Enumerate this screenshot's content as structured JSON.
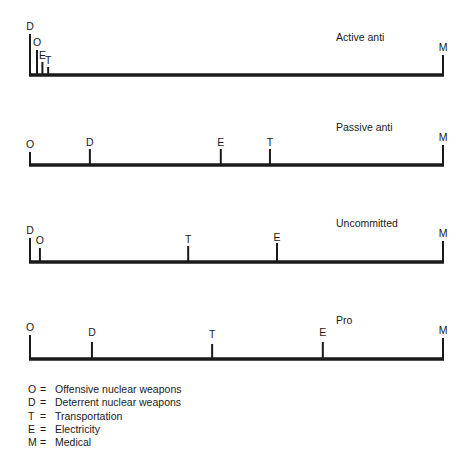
{
  "scale": {
    "x_start": 30,
    "x_end": 443
  },
  "panels": [
    {
      "title": "Active anti",
      "title_pos": {
        "x": 336,
        "y": 41
      },
      "baseline_y": 75,
      "markers": [
        {
          "key": "D",
          "pos": 0,
          "top": 34,
          "label_y": 30
        },
        {
          "key": "O",
          "pos": 1.7,
          "top": 50,
          "label_y": 46
        },
        {
          "key": "E",
          "pos": 3.0,
          "top": 62,
          "label_y": 59
        },
        {
          "key": "T",
          "pos": 4.4,
          "top": 67,
          "label_y": 64
        },
        {
          "key": "M",
          "pos": 100,
          "top": 55,
          "label_y": 51
        }
      ]
    },
    {
      "title": "Passive anti",
      "title_pos": {
        "x": 336,
        "y": 131
      },
      "baseline_y": 165,
      "markers": [
        {
          "key": "O",
          "pos": 0,
          "top": 152,
          "label_y": 148
        },
        {
          "key": "D",
          "pos": 14.5,
          "top": 149,
          "label_y": 146
        },
        {
          "key": "E",
          "pos": 46.2,
          "top": 149,
          "label_y": 146
        },
        {
          "key": "T",
          "pos": 58.1,
          "top": 149,
          "label_y": 146
        },
        {
          "key": "M",
          "pos": 100,
          "top": 145,
          "label_y": 141
        }
      ]
    },
    {
      "title": "Uncommitted",
      "title_pos": {
        "x": 336,
        "y": 227
      },
      "baseline_y": 262,
      "markers": [
        {
          "key": "D",
          "pos": 0,
          "top": 238,
          "label_y": 234
        },
        {
          "key": "O",
          "pos": 2.4,
          "top": 248,
          "label_y": 244
        },
        {
          "key": "T",
          "pos": 38.3,
          "top": 246,
          "label_y": 243
        },
        {
          "key": "E",
          "pos": 59.8,
          "top": 243,
          "label_y": 241
        },
        {
          "key": "M",
          "pos": 100,
          "top": 241,
          "label_y": 237
        }
      ]
    },
    {
      "title": "Pro",
      "title_pos": {
        "x": 336,
        "y": 324
      },
      "baseline_y": 359,
      "markers": [
        {
          "key": "O",
          "pos": 0,
          "top": 335,
          "label_y": 331
        },
        {
          "key": "D",
          "pos": 15.0,
          "top": 342,
          "label_y": 336
        },
        {
          "key": "T",
          "pos": 44.1,
          "top": 344,
          "label_y": 338
        },
        {
          "key": "E",
          "pos": 70.9,
          "top": 342,
          "label_y": 336
        },
        {
          "key": "M",
          "pos": 100,
          "top": 338,
          "label_y": 334
        }
      ]
    }
  ],
  "legend": [
    {
      "key": "O",
      "eq": "=",
      "label": "Offensive nuclear weapons"
    },
    {
      "key": "D",
      "eq": "=",
      "label": "Deterrent nuclear weapons"
    },
    {
      "key": "T",
      "eq": "=",
      "label": "Transportation"
    },
    {
      "key": "E",
      "eq": "=",
      "label": "Electricity"
    },
    {
      "key": "M",
      "eq": "=",
      "label": "Medical"
    }
  ],
  "colors": {
    "line": "#1a1a1a",
    "text": "#1a1a1a",
    "background": "#ffffff"
  }
}
